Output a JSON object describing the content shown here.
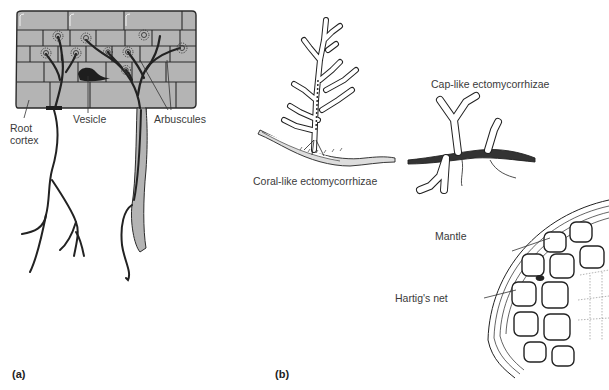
{
  "figure": {
    "panel_a": {
      "letter": "(a)",
      "title": "Arbuscular mycorrhiza in root cortex",
      "labels": {
        "root_cortex_line1": "Root",
        "root_cortex_line2": "cortex",
        "vesicle": "Vesicle",
        "arbuscules": "Arbuscules"
      },
      "colors": {
        "cortex_fill": "#b4b4b4",
        "outline": "#2a2a2a",
        "hyphae": "#222222"
      }
    },
    "panel_b": {
      "letter": "(b)",
      "labels": {
        "coral": "Coral-like ectomycorrhizae",
        "cap": "Cap-like ectomycorrhizae",
        "mantle": "Mantle",
        "hartig": "Hartig's net"
      }
    }
  }
}
